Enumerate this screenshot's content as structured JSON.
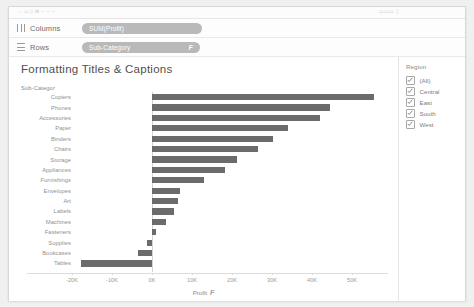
{
  "toolbar": {
    "ghost_left": "⌐  ▭  ▯                 ⊞        ─     ─      ─",
    "ghost_right": "▭▭▭        ▯"
  },
  "shelves": {
    "columns": {
      "label": "Columns",
      "pill": "SUM(Profit)",
      "icon": "columns-grid-icon"
    },
    "rows": {
      "label": "Rows",
      "pill": "Sub-Category",
      "sort_glyph": "F",
      "icon": "rows-grid-icon"
    }
  },
  "viz": {
    "title": "Formatting Titles & Captions",
    "row_field_header": "Sub-Categor",
    "axis_title": "Profit",
    "axis_sort_glyph": "F",
    "bar_color": "#6b6b6b"
  },
  "legend": {
    "title": "Region",
    "items": [
      {
        "label": "(All)",
        "checked": true
      },
      {
        "label": "Central",
        "checked": true
      },
      {
        "label": "East",
        "checked": true
      },
      {
        "label": "South",
        "checked": true
      },
      {
        "label": "West",
        "checked": true
      }
    ]
  },
  "chart_data": {
    "type": "bar",
    "orientation": "horizontal",
    "title": "Formatting Titles & Captions",
    "xlabel": "Profit",
    "ylabel": "Sub-Category",
    "xlim": [
      -25000,
      60000
    ],
    "grid": false,
    "legend_position": "right",
    "tick_labels": [
      "-20K",
      "-10K",
      "0K",
      "10K",
      "20K",
      "30K",
      "40K",
      "50K"
    ],
    "tick_values": [
      -20000,
      -10000,
      0,
      10000,
      20000,
      30000,
      40000,
      50000
    ],
    "categories": [
      "Copiers",
      "Phones",
      "Accessories",
      "Paper",
      "Binders",
      "Chairs",
      "Storage",
      "Appliances",
      "Furnishings",
      "Envelopes",
      "Art",
      "Labels",
      "Machines",
      "Fasteners",
      "Supplies",
      "Bookcases",
      "Tables"
    ],
    "values": [
      55618,
      44516,
      41937,
      34054,
      30222,
      26590,
      21279,
      18138,
      13059,
      6964,
      6528,
      5546,
      3385,
      950,
      -1189,
      -3473,
      -17725
    ]
  }
}
